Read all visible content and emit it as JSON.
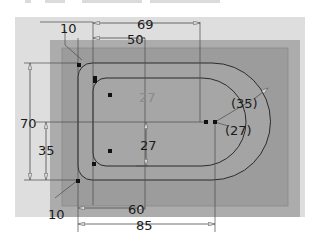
{
  "drawing": {
    "type": "CAD sketch - obround pocket with dimensions",
    "colors": {
      "background": "#ffffff",
      "sheet": "#dedede",
      "outer_block": "#acacac",
      "inner_block": "#9c9c9c",
      "line": "#2b2b2b",
      "dim_line": "#4a4a4a",
      "text": "#1a1a1a",
      "ghost_text": "#8a8a8a"
    },
    "dimensions": {
      "top_corner_radius": "10",
      "bottom_corner_radius": "10",
      "width_outer_top": "69",
      "width_inner_top": "50",
      "height_total": "70",
      "height_half": "35",
      "inner_half_height": "27",
      "ghost_label": "27",
      "radius_outer_ref": "(35)",
      "radius_inner_ref": "(27)",
      "width_inner_bottom": "60",
      "width_outer_bottom": "85"
    }
  }
}
